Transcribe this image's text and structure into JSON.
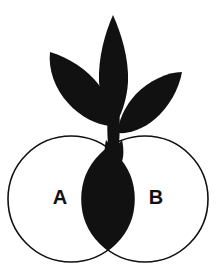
{
  "figure": {
    "background_color": "#ffffff",
    "ink_color": "#111111",
    "canvas": {
      "width": 216,
      "height": 269
    }
  },
  "venn": {
    "stroke_color": "#111111",
    "stroke_width": 1.6,
    "fill_color": "none",
    "intersection_fill": "#111111",
    "circles": [
      {
        "set_name": "A",
        "label": "A",
        "label_x": 60,
        "label_y": 197,
        "cx": 71,
        "cy": 199,
        "r": 63
      },
      {
        "set_name": "B",
        "label": "B",
        "label_x": 156,
        "label_y": 197,
        "cx": 145,
        "cy": 199,
        "r": 63
      }
    ]
  },
  "plant": {
    "color": "#111111",
    "seed": {
      "name": "seed-lens",
      "description": "Solid black lens shape formed by the circle intersection, doubling as the seed body."
    },
    "stem": {
      "name": "stem",
      "description": "Narrow black stalk rising from the seed up to the leaf junction."
    },
    "leaves": [
      {
        "name": "leaf-center",
        "orientation": "upright",
        "tip_x": 113,
        "tip_y": 15
      },
      {
        "name": "leaf-left",
        "orientation": "upper-left",
        "tip_x": 50,
        "tip_y": 52
      },
      {
        "name": "leaf-right",
        "orientation": "upper-right",
        "tip_x": 182,
        "tip_y": 72
      }
    ]
  }
}
